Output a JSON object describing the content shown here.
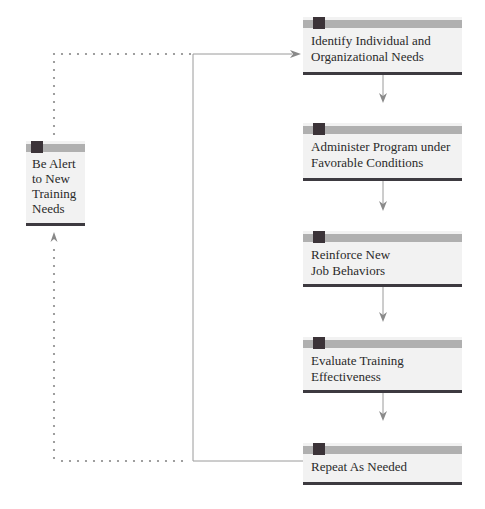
{
  "diagram": {
    "type": "flowchart",
    "steps": [
      {
        "id": "identify",
        "label": "Identify Individual and Organizational Needs",
        "lines": [
          "Identify Individual and",
          "Organizational Needs"
        ]
      },
      {
        "id": "administer",
        "label": "Administer Program under Favorable Conditions",
        "lines": [
          "Administer Program under",
          "Favorable Conditions"
        ]
      },
      {
        "id": "reinforce",
        "label": "Reinforce New Job Behaviors",
        "lines": [
          "Reinforce New",
          "Job Behaviors"
        ]
      },
      {
        "id": "evaluate",
        "label": "Evaluate Training Effectiveness",
        "lines": [
          "Evaluate Training",
          "Effectiveness"
        ]
      },
      {
        "id": "repeat",
        "label": "Repeat As Needed",
        "lines": [
          "Repeat As Needed"
        ]
      }
    ],
    "side_step": {
      "id": "alert",
      "label": "Be Alert to New Training Needs",
      "lines": [
        "Be Alert",
        "to New",
        "Training",
        "Needs"
      ]
    },
    "edges": [
      {
        "from": "identify",
        "to": "administer",
        "style": "solid"
      },
      {
        "from": "administer",
        "to": "reinforce",
        "style": "solid"
      },
      {
        "from": "reinforce",
        "to": "evaluate",
        "style": "solid"
      },
      {
        "from": "evaluate",
        "to": "repeat",
        "style": "solid"
      },
      {
        "from": "repeat",
        "to": "identify",
        "style": "solid",
        "note": "feedback loop on left"
      },
      {
        "from": "repeat",
        "to": "alert",
        "style": "dotted"
      },
      {
        "from": "alert",
        "to": "identify",
        "style": "dotted"
      }
    ],
    "colors": {
      "box_fill": "#f2f2f2",
      "band": "#b0b0b0",
      "square": "#3b3338",
      "rule": "#3d3a40",
      "line": "#999999",
      "dots": "#888888"
    }
  }
}
